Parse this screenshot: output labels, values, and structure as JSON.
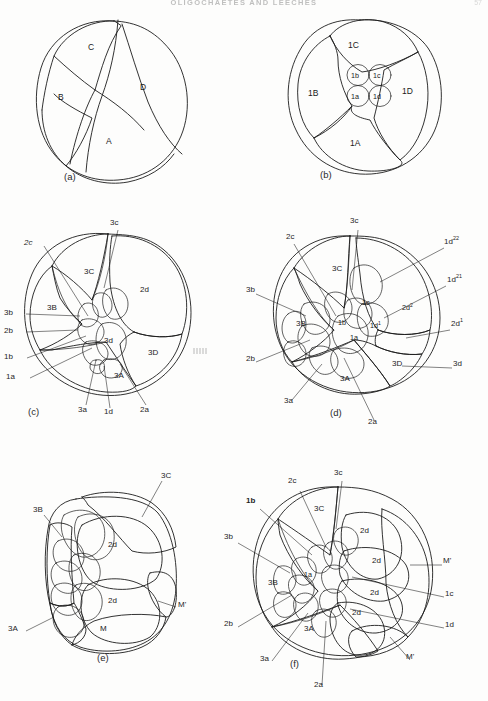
{
  "page": {
    "running_head": "OLIGOCHAETES AND LEECHES",
    "folio": "57",
    "background_color": "#fdfdfc",
    "ink_color": "#1c1c1c"
  },
  "figure": {
    "type": "line-drawing-plate",
    "panel_count": 6
  },
  "panels": [
    {
      "id": "a",
      "caption": "(a)",
      "view": "four-cell stage, animal pole view",
      "cells": [
        {
          "label": "C",
          "x": 96,
          "y": 48
        },
        {
          "label": "B",
          "x": 62,
          "y": 99
        },
        {
          "label": "D",
          "x": 143,
          "y": 89
        },
        {
          "label": "A",
          "x": 110,
          "y": 141
        }
      ],
      "leaders": []
    },
    {
      "id": "b",
      "caption": "(b)",
      "view": "eight-cell stage, first micromere quartet formed",
      "cells": [
        {
          "label": "1C",
          "x": 354,
          "y": 45
        },
        {
          "label": "1B",
          "x": 312,
          "y": 93
        },
        {
          "label": "1D",
          "x": 409,
          "y": 90
        },
        {
          "label": "1A",
          "x": 355,
          "y": 141
        },
        {
          "label": "1b",
          "x": 345,
          "y": 79
        },
        {
          "label": "1c",
          "x": 366,
          "y": 79
        },
        {
          "label": "1a",
          "x": 345,
          "y": 100
        },
        {
          "label": "1d",
          "x": 366,
          "y": 100
        }
      ],
      "leaders": []
    },
    {
      "id": "c",
      "caption": "(c)",
      "view": "third quartet stage, animal pole view",
      "cells": [
        {
          "label": "3C",
          "x": 90,
          "y": 272
        },
        {
          "label": "3B",
          "x": 54,
          "y": 308
        },
        {
          "label": "2d",
          "x": 146,
          "y": 289
        },
        {
          "label": "3d",
          "x": 108,
          "y": 337
        },
        {
          "label": "3D",
          "x": 150,
          "y": 349
        },
        {
          "label": "3A",
          "x": 118,
          "y": 378
        }
      ],
      "leaders": [
        {
          "label": "2c",
          "x": 29,
          "y": 239,
          "anchor": "left-top"
        },
        {
          "label": "3c",
          "x": 108,
          "y": 220,
          "anchor": "top"
        },
        {
          "label": "3b",
          "x": 4,
          "y": 312,
          "anchor": "left"
        },
        {
          "label": "2b",
          "x": 4,
          "y": 330,
          "anchor": "left"
        },
        {
          "label": "1b",
          "x": 4,
          "y": 357,
          "anchor": "left"
        },
        {
          "label": "1a",
          "x": 4,
          "y": 377,
          "anchor": "left"
        },
        {
          "label": "3a",
          "x": 73,
          "y": 408,
          "anchor": "bottom"
        },
        {
          "label": "1d",
          "x": 99,
          "y": 410,
          "anchor": "bottom"
        },
        {
          "label": "2a",
          "x": 141,
          "y": 408,
          "anchor": "bottom"
        }
      ]
    },
    {
      "id": "d",
      "caption": "(d)",
      "view": "later cleavage, 1d and 2d derivatives labelled",
      "cells": [
        {
          "label": "3C",
          "x": 338,
          "y": 268
        },
        {
          "label": "3B",
          "x": 303,
          "y": 323
        },
        {
          "label": "3A",
          "x": 345,
          "y": 378
        },
        {
          "label": "3D",
          "x": 398,
          "y": 363
        },
        {
          "label": "1b",
          "x": 344,
          "y": 319
        },
        {
          "label": "1c",
          "x": 368,
          "y": 300
        },
        {
          "label": "1a",
          "x": 356,
          "y": 335
        },
        {
          "label": "1d1",
          "x": 376,
          "y": 323,
          "superscript": "1"
        },
        {
          "label": "2d2",
          "x": 409,
          "y": 305,
          "superscript": "2"
        }
      ],
      "leaders": [
        {
          "label": "3c",
          "x": 351,
          "y": 219,
          "anchor": "top"
        },
        {
          "label": "2c",
          "x": 288,
          "y": 235,
          "anchor": "left-top"
        },
        {
          "label": "1d22",
          "x": 449,
          "y": 243,
          "anchor": "right",
          "superscript": "22"
        },
        {
          "label": "1d21",
          "x": 452,
          "y": 280,
          "anchor": "right",
          "superscript": "21"
        },
        {
          "label": "2d1",
          "x": 455,
          "y": 325,
          "anchor": "right",
          "superscript": "1"
        },
        {
          "label": "3d",
          "x": 457,
          "y": 363,
          "anchor": "right"
        },
        {
          "label": "3b",
          "x": 246,
          "y": 288,
          "anchor": "left"
        },
        {
          "label": "2b",
          "x": 246,
          "y": 356,
          "anchor": "left"
        },
        {
          "label": "3a",
          "x": 288,
          "y": 396,
          "anchor": "bottom"
        },
        {
          "label": "2a",
          "x": 372,
          "y": 415,
          "anchor": "bottom"
        }
      ]
    },
    {
      "id": "e",
      "caption": "(e)",
      "view": "germ band stage, lateral view",
      "cells": [
        {
          "label": "2d",
          "x": 113,
          "y": 536
        },
        {
          "label": "2d",
          "x": 113,
          "y": 592
        },
        {
          "label": "M",
          "x": 101,
          "y": 628
        }
      ],
      "leaders": [
        {
          "label": "3C",
          "x": 162,
          "y": 473,
          "anchor": "top-right"
        },
        {
          "label": "3B",
          "x": 35,
          "y": 509,
          "anchor": "left"
        },
        {
          "label": "3A",
          "x": 8,
          "y": 620,
          "anchor": "left-bottom"
        },
        {
          "label": "M'",
          "x": 177,
          "y": 607,
          "anchor": "right"
        }
      ]
    },
    {
      "id": "f",
      "caption": "(f)",
      "view": "germ band stage, dorsal view",
      "cells": [
        {
          "label": "3C",
          "x": 320,
          "y": 508
        },
        {
          "label": "3B",
          "x": 274,
          "y": 582
        },
        {
          "label": "3A",
          "x": 310,
          "y": 628
        },
        {
          "label": "1a",
          "x": 320,
          "y": 573
        },
        {
          "label": "2d",
          "x": 363,
          "y": 530
        },
        {
          "label": "2d",
          "x": 378,
          "y": 557
        },
        {
          "label": "2d",
          "x": 382,
          "y": 588
        },
        {
          "label": "2d",
          "x": 361,
          "y": 608
        },
        {
          "label": "M",
          "x": 395,
          "y": 648
        }
      ],
      "leaders": [
        {
          "label": "3c",
          "x": 337,
          "y": 470,
          "anchor": "top"
        },
        {
          "label": "2c",
          "x": 287,
          "y": 478,
          "anchor": "top-left"
        },
        {
          "label": "1b",
          "x": 248,
          "y": 499,
          "anchor": "left",
          "bold": true
        },
        {
          "label": "3b",
          "x": 226,
          "y": 533,
          "anchor": "left"
        },
        {
          "label": "2b",
          "x": 226,
          "y": 618,
          "anchor": "left"
        },
        {
          "label": "3a",
          "x": 261,
          "y": 653,
          "anchor": "bottom-left"
        },
        {
          "label": "2a",
          "x": 316,
          "y": 683,
          "anchor": "bottom"
        },
        {
          "label": "M'",
          "x": 441,
          "y": 560,
          "anchor": "right"
        },
        {
          "label": "1c",
          "x": 444,
          "y": 592,
          "anchor": "right"
        },
        {
          "label": "1d",
          "x": 444,
          "y": 623,
          "anchor": "right"
        },
        {
          "label": "M'",
          "x": 405,
          "y": 655,
          "anchor": "bottom-right"
        }
      ]
    }
  ],
  "shading_key": {
    "vertical_hatch": "3A / 3B / 3C ectodermal teloblast territory",
    "diagonal_hatch": "2d mesodermal / 2d derivatives",
    "stipple": "3D / M mesoteloblast territory",
    "blank": "undifferentiated blastomeres"
  }
}
